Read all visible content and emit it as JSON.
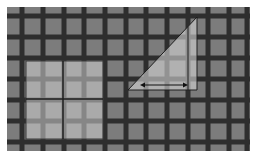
{
  "figure": {
    "background": "#ffffff",
    "board": {
      "x": 7,
      "y": 7,
      "width": 243,
      "height": 144,
      "fill": "#7c7c7c"
    },
    "grid": {
      "line_color": "#2e2e2e",
      "line_width": 5,
      "vertical_x": [
        22,
        43,
        64,
        84,
        105,
        126,
        146,
        167,
        188,
        208,
        229,
        247
      ],
      "horizontal_y": [
        16,
        37,
        58,
        79,
        100,
        121,
        142
      ]
    },
    "square": {
      "x": 26,
      "y": 61,
      "width": 77,
      "height": 78,
      "fill": "#cfcfcf",
      "opacity": 0.55,
      "cross_x": 63,
      "cross_y": 99,
      "cross_color": "#1e1e1e"
    },
    "triangle": {
      "points": [
        [
          128,
          90
        ],
        [
          197,
          17
        ],
        [
          197,
          90
        ]
      ],
      "fill": "#d6d6d6",
      "opacity": 0.6,
      "edge_color": "#1e1e1e",
      "inner_line_x": 188,
      "arrow": {
        "x1": 140,
        "x2": 188,
        "y": 85,
        "color": "#111111"
      }
    }
  }
}
